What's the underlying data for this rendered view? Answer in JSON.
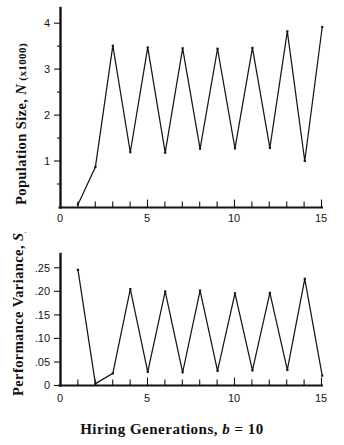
{
  "figure": {
    "xlabel_text": "Hiring  Generations, ",
    "xlabel_param": "b",
    "xlabel_value": " = 10"
  },
  "chart_data": [
    {
      "type": "line",
      "title": "",
      "xlabel": "Hiring Generations, b = 10",
      "ylabel": "Population Size, N (x1000)",
      "ylabel_main": "Population  Size, ",
      "ylabel_sym": "N",
      "ylabel_unit": " (x1000)",
      "xlim": [
        0,
        15.4
      ],
      "ylim": [
        0,
        4.35
      ],
      "xticks": [
        0,
        5,
        10,
        15
      ],
      "xtick_labels": [
        "0",
        "5",
        "10",
        "15"
      ],
      "xminor": [
        1,
        2,
        3,
        4,
        6,
        7,
        8,
        9,
        11,
        12,
        13,
        14
      ],
      "yticks": [
        1,
        2,
        3,
        4
      ],
      "ytick_labels": [
        "1",
        "2",
        "3",
        "4"
      ],
      "grid": false,
      "legend": "none",
      "x": [
        1,
        2,
        3,
        4,
        5,
        6,
        7,
        8,
        9,
        10,
        11,
        12,
        13,
        14,
        15
      ],
      "values": [
        0.07,
        0.93,
        3.72,
        1.27,
        3.68,
        1.26,
        3.66,
        1.35,
        3.65,
        1.36,
        3.67,
        1.37,
        4.05,
        1.07,
        4.15
      ]
    },
    {
      "type": "line",
      "title": "",
      "xlabel": "Hiring Generations, b = 10",
      "ylabel": "Performance Variance, S2z",
      "ylabel_main": "Performance  Variance, ",
      "ylabel_sym": "S",
      "ylabel_sub": "z",
      "ylabel_sup": "2",
      "xlim": [
        0,
        15.4
      ],
      "ylim": [
        0,
        0.285
      ],
      "xticks": [
        0,
        5,
        10,
        15
      ],
      "xtick_labels": [
        "0",
        "5",
        "10",
        "15"
      ],
      "xminor": [
        1,
        2,
        3,
        4,
        6,
        7,
        8,
        9,
        11,
        12,
        13,
        14
      ],
      "yticks": [
        0,
        0.05,
        0.1,
        0.15,
        0.2,
        0.25
      ],
      "ytick_labels": [
        "0",
        ".05",
        ".10",
        ".15",
        ".20",
        ".25"
      ],
      "grid": false,
      "legend": "none",
      "x": [
        1,
        2,
        3,
        4,
        5,
        6,
        7,
        8,
        9,
        10,
        11,
        12,
        13,
        14,
        15
      ],
      "values": [
        0.246,
        0.004,
        0.026,
        0.205,
        0.029,
        0.2,
        0.028,
        0.202,
        0.031,
        0.196,
        0.032,
        0.197,
        0.033,
        0.227,
        0.021
      ]
    }
  ]
}
